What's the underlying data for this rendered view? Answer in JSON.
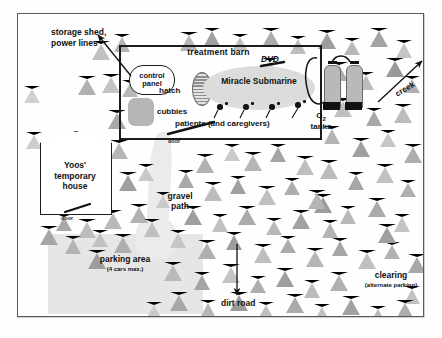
{
  "map": {
    "title": "treatment barn site map",
    "background_color": "#fdfdfd",
    "frame_color": "#5a5a5a"
  },
  "barn": {
    "label": "treatment barn",
    "border_color": "#1c1c1c",
    "control_panel": "control\npanel",
    "control_panel_line1": "control",
    "control_panel_line2": "panel",
    "cubbies": "cubbies",
    "hatch": "hatch",
    "submarine": "Miracle Submarine",
    "dvd": "DVD",
    "patients": "patients (and caregivers)",
    "door": "door",
    "patient_count": 4
  },
  "tanks": {
    "label_line1": "O",
    "label_sub": "2",
    "label_line2": "tanks",
    "count": 2,
    "color": "#b9b9b9"
  },
  "house": {
    "line1": "Yoos'",
    "line2": "temporary",
    "line3": "house",
    "door": "door"
  },
  "labels": {
    "storage_line1": "storage shed,",
    "storage_line2": "power lines",
    "gravel_line1": "gravel",
    "gravel_line2": "path",
    "parking": "parking area",
    "parking_sub": "(4 cars max.)",
    "dirt_road": "dirt road",
    "clearing": "clearing",
    "clearing_sub": "(alternate parking)",
    "creek": "creek"
  },
  "colors": {
    "tree_dark": "#8e8e8e",
    "tree_mid": "#aaaaaa",
    "tree_light": "#c6c6c6",
    "tree_pale": "#dcdcdc",
    "ground": "#e6e6e6",
    "submarine": "#dcdcdc",
    "ink": "#111111"
  },
  "trees": [
    {
      "x": 74,
      "y": 27,
      "s": 1.0,
      "c": "#c0c0c0"
    },
    {
      "x": 96,
      "y": 20,
      "s": 0.95,
      "c": "#b4b4b4"
    },
    {
      "x": 60,
      "y": 62,
      "s": 1.0,
      "c": "#b0b0b0"
    },
    {
      "x": 84,
      "y": 60,
      "s": 1.0,
      "c": "#c4c4c4"
    },
    {
      "x": 104,
      "y": 66,
      "s": 0.9,
      "c": "#b8b8b8"
    },
    {
      "x": 90,
      "y": 96,
      "s": 1.0,
      "c": "#a8a8a8"
    },
    {
      "x": 92,
      "y": 126,
      "s": 1.0,
      "c": "#b6b6b6"
    },
    {
      "x": 76,
      "y": 148,
      "s": 0.85,
      "c": "#cacaca"
    },
    {
      "x": 101,
      "y": 158,
      "s": 1.0,
      "c": "#9f9f9f"
    },
    {
      "x": 112,
      "y": 190,
      "s": 1.05,
      "c": "#b2b2b2"
    },
    {
      "x": 60,
      "y": 205,
      "s": 1.0,
      "c": "#bdbdbd"
    },
    {
      "x": 38,
      "y": 200,
      "s": 0.9,
      "c": "#a9a9a9"
    },
    {
      "x": 86,
      "y": 196,
      "s": 1.0,
      "c": "#b9b9b9"
    },
    {
      "x": 30,
      "y": 176,
      "s": 0.95,
      "c": "#c3c3c3"
    },
    {
      "x": 22,
      "y": 212,
      "s": 1.0,
      "c": "#a6a6a6"
    },
    {
      "x": 47,
      "y": 222,
      "s": 0.95,
      "c": "#b4b4b4"
    },
    {
      "x": 74,
      "y": 216,
      "s": 0.9,
      "c": "#c0c0c0"
    },
    {
      "x": 96,
      "y": 220,
      "s": 1.0,
      "c": "#aeaeae"
    },
    {
      "x": 70,
      "y": 236,
      "s": 1.05,
      "c": "#9d9d9d"
    },
    {
      "x": 126,
      "y": 205,
      "s": 0.95,
      "c": "#bfbfbf"
    },
    {
      "x": 138,
      "y": 178,
      "s": 0.85,
      "c": "#cbcbcb"
    },
    {
      "x": 120,
      "y": 150,
      "s": 0.9,
      "c": "#c8c8c8"
    },
    {
      "x": 8,
      "y": 118,
      "s": 0.9,
      "c": "#cdcdcd"
    },
    {
      "x": 6,
      "y": 72,
      "s": 0.9,
      "c": "#d0d0d0"
    },
    {
      "x": 162,
      "y": 18,
      "s": 1.0,
      "c": "#b6b6b6"
    },
    {
      "x": 186,
      "y": 14,
      "s": 0.95,
      "c": "#a2a2a2"
    },
    {
      "x": 214,
      "y": 20,
      "s": 0.9,
      "c": "#c2c2c2"
    },
    {
      "x": 244,
      "y": 14,
      "s": 1.0,
      "c": "#ababab"
    },
    {
      "x": 272,
      "y": 22,
      "s": 0.95,
      "c": "#bdbdbd"
    },
    {
      "x": 300,
      "y": 16,
      "s": 1.0,
      "c": "#9e9e9e"
    },
    {
      "x": 326,
      "y": 24,
      "s": 0.9,
      "c": "#b8b8b8"
    },
    {
      "x": 352,
      "y": 14,
      "s": 1.0,
      "c": "#a4a4a4"
    },
    {
      "x": 378,
      "y": 26,
      "s": 0.95,
      "c": "#c4c4c4"
    },
    {
      "x": 312,
      "y": 48,
      "s": 1.0,
      "c": "#adadad"
    },
    {
      "x": 340,
      "y": 58,
      "s": 0.95,
      "c": "#bdbdbd"
    },
    {
      "x": 368,
      "y": 44,
      "s": 1.0,
      "c": "#9a9a9a"
    },
    {
      "x": 386,
      "y": 62,
      "s": 0.9,
      "c": "#b0b0b0"
    },
    {
      "x": 316,
      "y": 84,
      "s": 1.0,
      "c": "#c0c0c0"
    },
    {
      "x": 348,
      "y": 94,
      "s": 0.95,
      "c": "#a8a8a8"
    },
    {
      "x": 376,
      "y": 90,
      "s": 1.0,
      "c": "#bcbcbc"
    },
    {
      "x": 306,
      "y": 112,
      "s": 0.95,
      "c": "#b4b4b4"
    },
    {
      "x": 334,
      "y": 124,
      "s": 1.0,
      "c": "#a0a0a0"
    },
    {
      "x": 362,
      "y": 116,
      "s": 0.9,
      "c": "#c6c6c6"
    },
    {
      "x": 386,
      "y": 130,
      "s": 1.0,
      "c": "#aeaeae"
    },
    {
      "x": 302,
      "y": 146,
      "s": 1.0,
      "c": "#bbbbbb"
    },
    {
      "x": 330,
      "y": 158,
      "s": 0.95,
      "c": "#a6a6a6"
    },
    {
      "x": 358,
      "y": 150,
      "s": 1.0,
      "c": "#c2c2c2"
    },
    {
      "x": 382,
      "y": 166,
      "s": 0.9,
      "c": "#b0b0b0"
    },
    {
      "x": 296,
      "y": 180,
      "s": 1.0,
      "c": "#9c9c9c"
    },
    {
      "x": 322,
      "y": 192,
      "s": 0.95,
      "c": "#b8b8b8"
    },
    {
      "x": 350,
      "y": 184,
      "s": 1.0,
      "c": "#aaaaaa"
    },
    {
      "x": 376,
      "y": 200,
      "s": 0.95,
      "c": "#c4c4c4"
    },
    {
      "x": 244,
      "y": 44,
      "s": 0.9,
      "c": "#c8c8c8"
    },
    {
      "x": 226,
      "y": 138,
      "s": 1.0,
      "c": "#b6b6b6"
    },
    {
      "x": 252,
      "y": 130,
      "s": 0.95,
      "c": "#a4a4a4"
    },
    {
      "x": 278,
      "y": 142,
      "s": 1.0,
      "c": "#bebebe"
    },
    {
      "x": 206,
      "y": 130,
      "s": 0.9,
      "c": "#cacaca"
    },
    {
      "x": 178,
      "y": 140,
      "s": 1.0,
      "c": "#b2b2b2"
    },
    {
      "x": 160,
      "y": 156,
      "s": 0.95,
      "c": "#a8a8a8"
    },
    {
      "x": 186,
      "y": 168,
      "s": 1.0,
      "c": "#bcbcbc"
    },
    {
      "x": 212,
      "y": 162,
      "s": 0.95,
      "c": "#a0a0a0"
    },
    {
      "x": 240,
      "y": 172,
      "s": 1.0,
      "c": "#c0c0c0"
    },
    {
      "x": 266,
      "y": 164,
      "s": 0.9,
      "c": "#aeaeae"
    },
    {
      "x": 290,
      "y": 176,
      "s": 1.0,
      "c": "#b4b4b4"
    },
    {
      "x": 166,
      "y": 192,
      "s": 1.0,
      "c": "#9e9e9e"
    },
    {
      "x": 194,
      "y": 200,
      "s": 0.95,
      "c": "#c2c2c2"
    },
    {
      "x": 220,
      "y": 192,
      "s": 1.0,
      "c": "#aaaaaa"
    },
    {
      "x": 248,
      "y": 204,
      "s": 0.9,
      "c": "#b8b8b8"
    },
    {
      "x": 274,
      "y": 196,
      "s": 1.0,
      "c": "#a2a2a2"
    },
    {
      "x": 152,
      "y": 216,
      "s": 0.95,
      "c": "#c6c6c6"
    },
    {
      "x": 180,
      "y": 226,
      "s": 1.0,
      "c": "#b0b0b0"
    },
    {
      "x": 208,
      "y": 218,
      "s": 0.95,
      "c": "#9c9c9c"
    },
    {
      "x": 236,
      "y": 230,
      "s": 1.0,
      "c": "#bebebe"
    },
    {
      "x": 262,
      "y": 222,
      "s": 0.9,
      "c": "#acacac"
    },
    {
      "x": 288,
      "y": 234,
      "s": 1.0,
      "c": "#b6b6b6"
    },
    {
      "x": 314,
      "y": 224,
      "s": 0.95,
      "c": "#a6a6a6"
    },
    {
      "x": 340,
      "y": 236,
      "s": 1.0,
      "c": "#c0c0c0"
    },
    {
      "x": 366,
      "y": 228,
      "s": 0.9,
      "c": "#b2b2b2"
    },
    {
      "x": 390,
      "y": 240,
      "s": 1.0,
      "c": "#a8a8a8"
    },
    {
      "x": 146,
      "y": 248,
      "s": 1.0,
      "c": "#bababa"
    },
    {
      "x": 176,
      "y": 258,
      "s": 0.95,
      "c": "#a4a4a4"
    },
    {
      "x": 204,
      "y": 250,
      "s": 1.0,
      "c": "#c4c4c4"
    },
    {
      "x": 232,
      "y": 262,
      "s": 0.9,
      "c": "#aeaeae"
    },
    {
      "x": 258,
      "y": 254,
      "s": 1.0,
      "c": "#9e9e9e"
    },
    {
      "x": 286,
      "y": 266,
      "s": 0.95,
      "c": "#bcbcbc"
    },
    {
      "x": 312,
      "y": 258,
      "s": 1.0,
      "c": "#b0b0b0"
    },
    {
      "x": 386,
      "y": 272,
      "s": 0.95,
      "c": "#c2c2c2"
    },
    {
      "x": 152,
      "y": 278,
      "s": 1.0,
      "c": "#a8a8a8"
    },
    {
      "x": 182,
      "y": 286,
      "s": 0.95,
      "c": "#b6b6b6"
    },
    {
      "x": 212,
      "y": 278,
      "s": 1.0,
      "c": "#9c9c9c"
    },
    {
      "x": 240,
      "y": 288,
      "s": 0.9,
      "c": "#bebebe"
    },
    {
      "x": 268,
      "y": 280,
      "s": 1.0,
      "c": "#aaaaaa"
    },
    {
      "x": 296,
      "y": 290,
      "s": 0.95,
      "c": "#c0c0c0"
    },
    {
      "x": 324,
      "y": 282,
      "s": 1.0,
      "c": "#a2a2a2"
    },
    {
      "x": 352,
      "y": 292,
      "s": 0.9,
      "c": "#b8b8b8"
    },
    {
      "x": 378,
      "y": 286,
      "s": 1.0,
      "c": "#acacac"
    },
    {
      "x": 128,
      "y": 288,
      "s": 0.9,
      "c": "#cacaca"
    },
    {
      "x": 304,
      "y": 206,
      "s": 0.95,
      "c": "#b4b4b4"
    },
    {
      "x": 360,
      "y": 210,
      "s": 1.0,
      "c": "#9f9f9f"
    }
  ]
}
